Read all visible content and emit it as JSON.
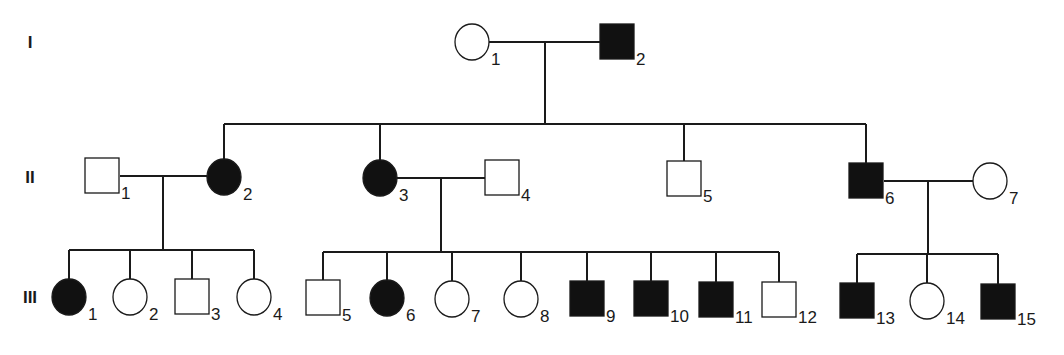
{
  "diagram": {
    "type": "pedigree",
    "colors": {
      "affected": "#111111",
      "unaffected": "#ffffff",
      "line": "#1a1a1a"
    },
    "generations": [
      {
        "label": "I",
        "y": 42
      },
      {
        "label": "II",
        "y": 177
      },
      {
        "label": "III",
        "y": 297
      }
    ],
    "individuals": [
      {
        "gen": "I",
        "num": "1",
        "sex": "female",
        "affected": false,
        "cx": 472,
        "cy": 42
      },
      {
        "gen": "I",
        "num": "2",
        "sex": "male",
        "affected": true,
        "cx": 617,
        "cy": 42
      },
      {
        "gen": "II",
        "num": "1",
        "sex": "male",
        "affected": false,
        "cx": 102,
        "cy": 176
      },
      {
        "gen": "II",
        "num": "2",
        "sex": "female",
        "affected": true,
        "cx": 224,
        "cy": 177
      },
      {
        "gen": "II",
        "num": "3",
        "sex": "female",
        "affected": true,
        "cx": 380,
        "cy": 178
      },
      {
        "gen": "II",
        "num": "4",
        "sex": "male",
        "affected": false,
        "cx": 502,
        "cy": 178
      },
      {
        "gen": "II",
        "num": "5",
        "sex": "male",
        "affected": false,
        "cx": 684,
        "cy": 179
      },
      {
        "gen": "II",
        "num": "6",
        "sex": "male",
        "affected": true,
        "cx": 866,
        "cy": 181
      },
      {
        "gen": "II",
        "num": "7",
        "sex": "female",
        "affected": false,
        "cx": 990,
        "cy": 181
      },
      {
        "gen": "III",
        "num": "1",
        "sex": "female",
        "affected": true,
        "cx": 69,
        "cy": 297
      },
      {
        "gen": "III",
        "num": "2",
        "sex": "female",
        "affected": false,
        "cx": 130,
        "cy": 297
      },
      {
        "gen": "III",
        "num": "3",
        "sex": "male",
        "affected": false,
        "cx": 192,
        "cy": 297
      },
      {
        "gen": "III",
        "num": "4",
        "sex": "female",
        "affected": false,
        "cx": 254,
        "cy": 297
      },
      {
        "gen": "III",
        "num": "5",
        "sex": "male",
        "affected": false,
        "cx": 323,
        "cy": 298
      },
      {
        "gen": "III",
        "num": "6",
        "sex": "female",
        "affected": true,
        "cx": 387,
        "cy": 298
      },
      {
        "gen": "III",
        "num": "7",
        "sex": "female",
        "affected": false,
        "cx": 452,
        "cy": 299
      },
      {
        "gen": "III",
        "num": "8",
        "sex": "female",
        "affected": false,
        "cx": 521,
        "cy": 299
      },
      {
        "gen": "III",
        "num": "9",
        "sex": "male",
        "affected": true,
        "cx": 587,
        "cy": 299
      },
      {
        "gen": "III",
        "num": "10",
        "sex": "male",
        "affected": true,
        "cx": 651,
        "cy": 299
      },
      {
        "gen": "III",
        "num": "11",
        "sex": "male",
        "affected": true,
        "cx": 716,
        "cy": 300
      },
      {
        "gen": "III",
        "num": "12",
        "sex": "male",
        "affected": false,
        "cx": 779,
        "cy": 300
      },
      {
        "gen": "III",
        "num": "13",
        "sex": "male",
        "affected": true,
        "cx": 857,
        "cy": 301
      },
      {
        "gen": "III",
        "num": "14",
        "sex": "female",
        "affected": false,
        "cx": 927,
        "cy": 301
      },
      {
        "gen": "III",
        "num": "15",
        "sex": "male",
        "affected": true,
        "cx": 998,
        "cy": 302
      }
    ],
    "matings": [
      {
        "between": [
          "I-1",
          "I-2"
        ],
        "x1": 489,
        "x2": 600,
        "y": 42,
        "descent_x": 545
      },
      {
        "between": [
          "II-1",
          "II-2"
        ],
        "x1": 120,
        "x2": 207,
        "y": 176,
        "descent_x": 163
      },
      {
        "between": [
          "II-3",
          "II-4"
        ],
        "x1": 397,
        "x2": 485,
        "y": 178,
        "descent_x": 441
      },
      {
        "between": [
          "II-6",
          "II-7"
        ],
        "x1": 884,
        "x2": 973,
        "y": 181,
        "descent_x": 928
      }
    ],
    "sibships": [
      {
        "parents": "I-1 x I-2",
        "children": [
          "II-2",
          "II-3",
          "II-5",
          "II-6"
        ],
        "top_y": 42,
        "bar_y": 124,
        "descent_x": 545,
        "child_xs": [
          224,
          380,
          684,
          866
        ],
        "child_tops": [
          160,
          161,
          161,
          163
        ]
      },
      {
        "parents": "II-1 x II-2",
        "children": [
          "III-1",
          "III-2",
          "III-3",
          "III-4"
        ],
        "top_y": 176,
        "bar_y": 250,
        "descent_x": 163,
        "child_xs": [
          69,
          130,
          192,
          254
        ],
        "child_tops": [
          280,
          280,
          280,
          280
        ]
      },
      {
        "parents": "II-3 x II-4",
        "children": [
          "III-5",
          "III-6",
          "III-7",
          "III-8",
          "III-9",
          "III-10",
          "III-11",
          "III-12"
        ],
        "top_y": 178,
        "bar_y": 252,
        "descent_x": 441,
        "child_xs": [
          323,
          387,
          452,
          521,
          587,
          651,
          716,
          779
        ],
        "child_tops": [
          281,
          281,
          282,
          282,
          282,
          282,
          283,
          283
        ]
      },
      {
        "parents": "II-6 x II-7",
        "children": [
          "III-13",
          "III-14",
          "III-15"
        ],
        "top_y": 181,
        "bar_y": 254,
        "descent_x": 928,
        "child_xs": [
          857,
          927,
          998
        ],
        "child_tops": [
          284,
          284,
          285
        ]
      }
    ]
  }
}
